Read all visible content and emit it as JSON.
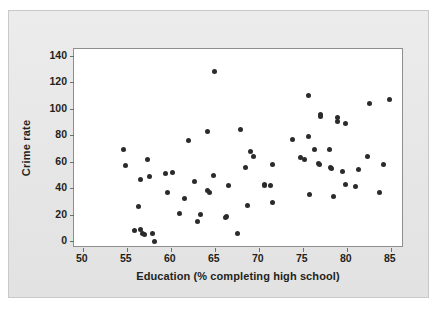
{
  "chart_data": {
    "type": "scatter",
    "title": "",
    "xlabel": "Education (% completing high school)",
    "ylabel": "Crime rate",
    "xlim": [
      49,
      86.5
    ],
    "ylim": [
      -5,
      145
    ],
    "xticks": [
      50,
      55,
      60,
      65,
      70,
      75,
      80,
      85
    ],
    "yticks": [
      0,
      20,
      40,
      60,
      80,
      100,
      120,
      140
    ],
    "grid": false,
    "legend": null,
    "marker": {
      "shape": "circle",
      "color": "#2b2b2b",
      "size": 5
    },
    "series": [
      {
        "name": "States",
        "points": [
          [
            54.6,
            69
          ],
          [
            54.8,
            57
          ],
          [
            55.9,
            8
          ],
          [
            56.3,
            26
          ],
          [
            56.5,
            47
          ],
          [
            56.6,
            9
          ],
          [
            56.8,
            6
          ],
          [
            57.0,
            5
          ],
          [
            57.3,
            62
          ],
          [
            57.6,
            49
          ],
          [
            57.9,
            6
          ],
          [
            58.2,
            0
          ],
          [
            59.4,
            51
          ],
          [
            59.6,
            37
          ],
          [
            60.2,
            52
          ],
          [
            61.0,
            21
          ],
          [
            61.5,
            32
          ],
          [
            62.0,
            76
          ],
          [
            62.7,
            45
          ],
          [
            63.0,
            15
          ],
          [
            63.4,
            20
          ],
          [
            64.2,
            83
          ],
          [
            64.2,
            38
          ],
          [
            64.4,
            37
          ],
          [
            64.8,
            50
          ],
          [
            65.0,
            128
          ],
          [
            66.2,
            18
          ],
          [
            66.3,
            19
          ],
          [
            66.6,
            42
          ],
          [
            67.6,
            6
          ],
          [
            67.9,
            84
          ],
          [
            68.5,
            56
          ],
          [
            68.7,
            27
          ],
          [
            69.1,
            68
          ],
          [
            69.4,
            64
          ],
          [
            70.6,
            43
          ],
          [
            70.7,
            42
          ],
          [
            71.3,
            42
          ],
          [
            71.5,
            58
          ],
          [
            71.6,
            29
          ],
          [
            73.8,
            77
          ],
          [
            74.7,
            63
          ],
          [
            75.2,
            62
          ],
          [
            75.6,
            110
          ],
          [
            75.7,
            79
          ],
          [
            75.8,
            35
          ],
          [
            76.3,
            69
          ],
          [
            76.8,
            59
          ],
          [
            76.9,
            58
          ],
          [
            77.0,
            96
          ],
          [
            77.0,
            94
          ],
          [
            78.0,
            69
          ],
          [
            78.2,
            56
          ],
          [
            78.3,
            55
          ],
          [
            78.5,
            34
          ],
          [
            78.9,
            93
          ],
          [
            78.9,
            90
          ],
          [
            79.5,
            53
          ],
          [
            79.8,
            89
          ],
          [
            79.9,
            43
          ],
          [
            81.0,
            41
          ],
          [
            81.3,
            54
          ],
          [
            82.3,
            64
          ],
          [
            82.6,
            104
          ],
          [
            83.7,
            37
          ],
          [
            84.2,
            58
          ],
          [
            84.9,
            107
          ]
        ]
      }
    ]
  },
  "axes": {
    "y_title": "Crime rate",
    "x_title": "Education (% completing high school)",
    "y_tick_labels": [
      "140",
      "120",
      "100",
      "80",
      "60",
      "40",
      "20",
      "0"
    ],
    "x_tick_labels": [
      "50",
      "55",
      "60",
      "65",
      "70",
      "75",
      "80",
      "85"
    ]
  },
  "colors": {
    "page_background": "#ffffff",
    "panel_background": "#e8e8e8",
    "plot_background": "#ffffff",
    "axis_line": "#8e8e8e",
    "marker": "#2b2b2b",
    "text": "#231f20"
  }
}
